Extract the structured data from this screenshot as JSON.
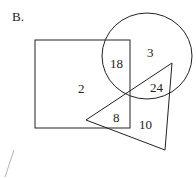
{
  "title": "B.",
  "shapes": {
    "square": {
      "x": 35,
      "y": 40,
      "width": 95,
      "height": 88
    },
    "circle": {
      "cx": 147,
      "cy": 55,
      "r": 46
    },
    "triangle": {
      "points": "86,120 165,150 172,63"
    },
    "stray_line": {
      "x1": 14,
      "y1": 150,
      "x2": 5,
      "y2": 177
    }
  },
  "regions": [
    {
      "id": "square-only",
      "value": "2"
    },
    {
      "id": "square-circle",
      "value": "18"
    },
    {
      "id": "circle-only",
      "value": "3"
    },
    {
      "id": "circle-triangle",
      "value": "24"
    },
    {
      "id": "square-triangle",
      "value": "8"
    },
    {
      "id": "triangle-only",
      "value": "10"
    }
  ],
  "colors": {
    "stroke": "#222222",
    "stray": "#b0b0b0",
    "text": "#222222"
  }
}
